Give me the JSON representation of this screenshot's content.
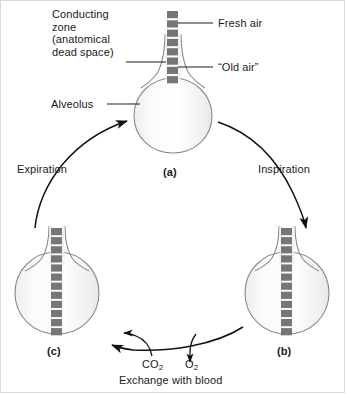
{
  "figure": {
    "background_color": "#ffffff",
    "text_color": "#1a1a1a",
    "square_color": "#767676",
    "alveolus_fill": "#f5f5f5",
    "alveolus_stroke": "#8a8a8a",
    "arrow_color": "#111111"
  },
  "labels": {
    "conducting_zone": "Conducting\nzone\n(anatomical\ndead space)",
    "alveolus": "Alveolus",
    "fresh_air": "Fresh air",
    "old_air": "“Old air”",
    "expiration": "Expiration",
    "inspiration": "Inspiration",
    "exchange_with_blood": "Exchange with blood"
  },
  "gases": {
    "co2_text": "CO",
    "co2_sub": "2",
    "o2_text": "O",
    "o2_sub": "2"
  },
  "panels": [
    {
      "id": "a",
      "label": "(a)",
      "squares": 8,
      "description": "Alveolus at end of expiration with old air in conducting zone"
    },
    {
      "id": "b",
      "label": "(b)",
      "squares": 12,
      "description": "Alveolus after inspiration, fresh air drawn into alveolus"
    },
    {
      "id": "c",
      "label": "(c)",
      "squares": 12,
      "description": "Alveolus after gas exchange with blood"
    }
  ]
}
